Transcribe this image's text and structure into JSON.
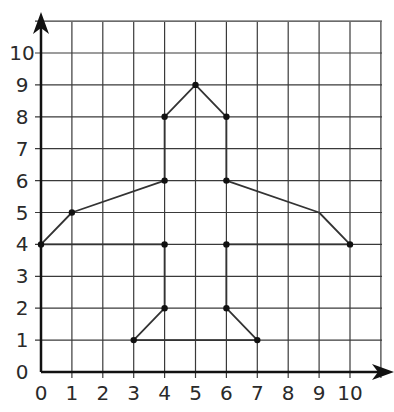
{
  "diagram": {
    "type": "coordinate-grid",
    "x_ticks": [
      "0",
      "1",
      "2",
      "3",
      "4",
      "5",
      "6",
      "7",
      "8",
      "9",
      "10"
    ],
    "y_ticks": [
      "0",
      "1",
      "2",
      "3",
      "4",
      "5",
      "6",
      "7",
      "8",
      "9",
      "10"
    ],
    "shape_name": "airplane",
    "outline": [
      [
        4,
        8
      ],
      [
        5,
        9
      ],
      [
        6,
        8
      ],
      [
        6,
        6
      ],
      [
        9,
        5
      ],
      [
        10,
        4
      ],
      [
        6,
        4
      ],
      [
        6,
        2
      ],
      [
        7,
        1
      ],
      [
        3,
        1
      ],
      [
        4,
        2
      ],
      [
        4,
        4
      ],
      [
        0,
        4
      ],
      [
        1,
        5
      ],
      [
        4,
        6
      ],
      [
        4,
        8
      ]
    ],
    "marked_points": [
      [
        5,
        9
      ],
      [
        4,
        8
      ],
      [
        6,
        8
      ],
      [
        4,
        6
      ],
      [
        6,
        6
      ],
      [
        1,
        5
      ],
      [
        0,
        4
      ],
      [
        4,
        4
      ],
      [
        6,
        4
      ],
      [
        10,
        4
      ],
      [
        4,
        2
      ],
      [
        6,
        2
      ],
      [
        3,
        1
      ],
      [
        7,
        1
      ]
    ],
    "colors": {
      "grid": "#3a3a3a",
      "shape": "#333333",
      "axis": "#111111"
    }
  }
}
